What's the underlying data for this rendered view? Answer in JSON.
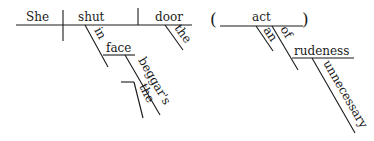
{
  "diagram": {
    "type": "Reed-Kellogg sentence diagram",
    "main_clause": {
      "subject": "She",
      "verb": "shut",
      "object": "door",
      "object_modifier": "the",
      "prepositional_phrase": {
        "preposition": "in",
        "object": "face",
        "object_modifier": "beggar's",
        "possessive_modifier": "the"
      }
    },
    "appositive": {
      "open_paren": "(",
      "close_paren": ")",
      "head": "act",
      "article": "an",
      "prepositional_phrase": {
        "preposition": "of",
        "object": "rudeness",
        "object_modifier": "unnecessary"
      }
    }
  }
}
